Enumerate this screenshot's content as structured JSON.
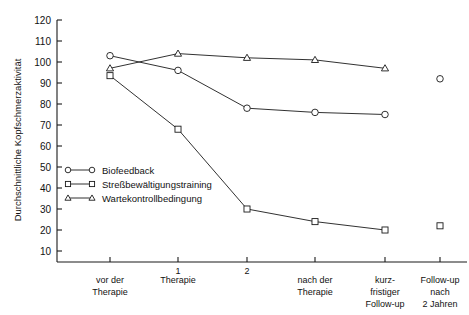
{
  "chart_data": {
    "type": "line",
    "title": "",
    "xlabel": "",
    "ylabel": "Durchschnittliche Kopfschmerzaktivität",
    "ylim": [
      0,
      120
    ],
    "ytick_step": 10,
    "yticks": [
      120,
      110,
      100,
      90,
      80,
      70,
      60,
      50,
      40,
      30,
      20,
      10
    ],
    "grid": false,
    "legend_position": "inside-left",
    "categories": [
      "vor der Therapie",
      "Therapie 1",
      "Therapie 2",
      "nach der Therapie",
      "kurzfristiger Follow-up",
      "Follow-up nach 2 Jahren"
    ],
    "x_axis_labels": [
      {
        "lines": [
          "vor der",
          "Therapie"
        ],
        "tick_index": 0,
        "small_number": ""
      },
      {
        "lines": [
          "Therapie"
        ],
        "tick_index": 1,
        "small_number": "1"
      },
      {
        "lines": [
          ""
        ],
        "tick_index": 2,
        "small_number": "2"
      },
      {
        "lines": [
          "nach der",
          "Therapie"
        ],
        "tick_index": 3,
        "small_number": ""
      },
      {
        "lines": [
          "kurz-",
          "fristiger",
          "Follow-up"
        ],
        "tick_index": 4,
        "small_number": ""
      },
      {
        "lines": [
          "Follow-up",
          "nach",
          "2 Jahren"
        ],
        "tick_index": 5,
        "small_number": ""
      }
    ],
    "series": [
      {
        "name": "Biofeedback",
        "marker": "circle",
        "values": [
          103,
          96,
          78,
          76,
          75,
          92
        ],
        "gap_before_last": true
      },
      {
        "name": "Streßbewältigungstraining",
        "marker": "square",
        "values": [
          93.5,
          68,
          30,
          24,
          20,
          22
        ],
        "gap_before_last": true
      },
      {
        "name": "Wartekontrollbedingung",
        "marker": "triangle",
        "values": [
          97,
          104,
          102,
          101,
          97,
          null
        ],
        "gap_before_last": false
      }
    ],
    "colors": {
      "axis": "#1a1a1a",
      "line": "#1a1a1a",
      "marker_fill": "#ffffff",
      "background": "#ffffff"
    }
  },
  "legend": {
    "entries": [
      {
        "label": "Biofeedback",
        "marker": "circle"
      },
      {
        "label": "Streßbewältigungstraining",
        "marker": "square"
      },
      {
        "label": "Wartekontrollbedingung",
        "marker": "triangle"
      }
    ]
  },
  "axis": {
    "y_title": "Durchschnittliche Kopfschmerzaktivität"
  }
}
